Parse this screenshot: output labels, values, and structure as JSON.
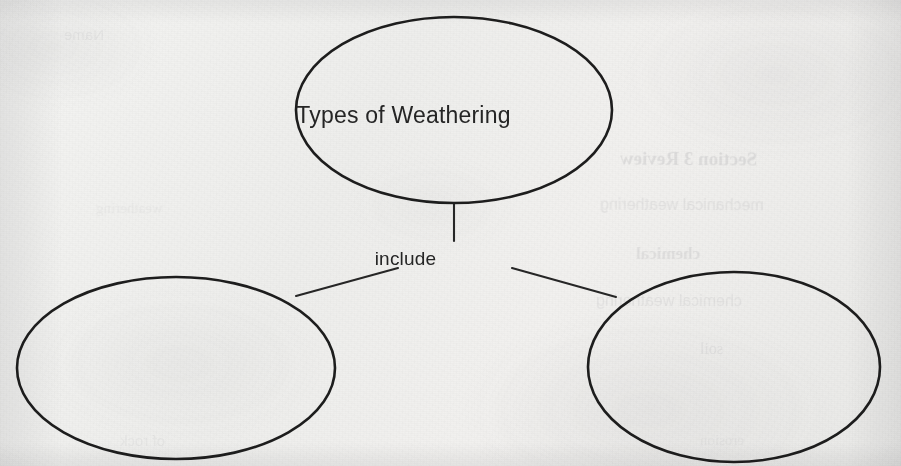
{
  "document": {
    "type": "concept-map-worksheet",
    "medium": "scanned printed paper",
    "background_color": "#f1f1ef",
    "ink_color": "#1d1d1d"
  },
  "diagram": {
    "kind": "concept map",
    "root": {
      "id": "root",
      "label": "Types of Weathering",
      "shape": "ellipse",
      "filled": false,
      "cx": 454,
      "cy": 110,
      "rx": 158,
      "ry": 93
    },
    "relation_label": {
      "id": "include",
      "label": "include",
      "x": 454,
      "y": 260
    },
    "children": [
      {
        "id": "child-left",
        "label": "",
        "shape": "ellipse",
        "filled": false,
        "cx": 176,
        "cy": 368,
        "rx": 159,
        "ry": 91
      },
      {
        "id": "child-right",
        "label": "",
        "shape": "ellipse",
        "filled": false,
        "cx": 734,
        "cy": 367,
        "rx": 146,
        "ry": 95
      }
    ],
    "connectors": [
      {
        "id": "stem",
        "from": "root",
        "to": "include",
        "kind": "vertical"
      },
      {
        "id": "branch-left",
        "from": "include",
        "to": "child-left",
        "kind": "diagonal"
      },
      {
        "id": "branch-right",
        "from": "include",
        "to": "child-right",
        "kind": "diagonal"
      }
    ]
  },
  "bleed_through": {
    "note": "faint mirrored text showing through from the reverse side of the page",
    "lines": [
      {
        "text": "Section 3 Review",
        "x": 620,
        "y": 148,
        "size": 19,
        "bold": true,
        "opacity": 0.13,
        "rotate": -0.4
      },
      {
        "text": "mechanical weathering",
        "x": 600,
        "y": 196,
        "size": 16,
        "bold": false,
        "opacity": 0.1,
        "rotate": -0.3
      },
      {
        "text": "chemical",
        "x": 636,
        "y": 244,
        "size": 17,
        "bold": true,
        "opacity": 0.11,
        "rotate": 0.2
      },
      {
        "text": "chemical weathering",
        "x": 596,
        "y": 292,
        "size": 16,
        "bold": false,
        "opacity": 0.09,
        "rotate": -0.2
      },
      {
        "text": "soil",
        "x": 700,
        "y": 340,
        "size": 16,
        "bold": false,
        "opacity": 0.09,
        "rotate": 0.1
      },
      {
        "text": "Name",
        "x": 64,
        "y": 26,
        "size": 15,
        "bold": false,
        "opacity": 0.07,
        "rotate": -0.3
      },
      {
        "text": "weathering",
        "x": 96,
        "y": 200,
        "size": 15,
        "bold": false,
        "opacity": 0.06,
        "rotate": 0.2
      },
      {
        "text": "of rock",
        "x": 120,
        "y": 432,
        "size": 15,
        "bold": false,
        "opacity": 0.06,
        "rotate": -0.2
      },
      {
        "text": "erosion",
        "x": 700,
        "y": 432,
        "size": 15,
        "bold": false,
        "opacity": 0.06,
        "rotate": 0.2
      }
    ]
  }
}
